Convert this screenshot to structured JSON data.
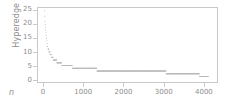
{
  "chart_data": {
    "type": "line",
    "title": "",
    "xlabel": "n",
    "ylabel": "Hyperedge size",
    "xlim": [
      -150,
      4350
    ],
    "ylim": [
      -1,
      26
    ],
    "grid": false,
    "legend": null,
    "xticks": [
      0,
      1000,
      2000,
      3000,
      4000
    ],
    "xtick_labels": [
      "0",
      "1000",
      "2000",
      "3000",
      "4000"
    ],
    "yticks": [
      0,
      5,
      10,
      15,
      20,
      25
    ],
    "ytick_labels": [
      "0",
      "5",
      "10",
      "15",
      "20",
      "25"
    ],
    "series": [
      {
        "name": "hyperedge size (sorted descending)",
        "color": "#b9b9b9",
        "marker": "dot",
        "x": [
          1,
          3,
          6,
          10,
          15,
          20,
          26,
          32,
          38,
          45,
          52,
          60,
          68,
          76,
          85,
          95,
          105,
          118,
          132,
          148,
          165,
          185,
          205,
          230,
          258,
          290,
          325,
          365,
          410,
          460,
          520,
          585,
          660,
          745,
          840,
          950,
          1080,
          1230,
          1400,
          1600,
          1850,
          2150,
          2500,
          2900,
          3220,
          3500,
          3800,
          4000,
          4120
        ],
        "y": [
          25,
          24,
          23,
          22,
          21,
          20,
          19,
          18,
          17,
          16,
          15,
          14,
          13,
          12,
          12,
          11,
          11,
          10,
          10,
          9,
          9,
          8,
          8,
          7,
          7,
          7,
          6,
          6,
          6,
          5,
          5,
          5,
          5,
          4,
          4,
          4,
          4,
          4,
          3,
          3,
          3,
          3,
          3,
          3,
          2,
          2,
          2,
          1,
          1
        ]
      }
    ],
    "steps": [
      {
        "size": 5,
        "x_start": 440,
        "x_end": 700
      },
      {
        "size": 4,
        "x_start": 700,
        "x_end": 1270
      },
      {
        "size": 3,
        "x_start": 1270,
        "x_end": 2150
      },
      {
        "size": 3,
        "x_start": 2150,
        "x_end": 3180
      },
      {
        "size": 2,
        "x_start": 3180,
        "x_end": 3880
      },
      {
        "size": 1,
        "x_start": 3880,
        "x_end": 4130
      }
    ]
  }
}
